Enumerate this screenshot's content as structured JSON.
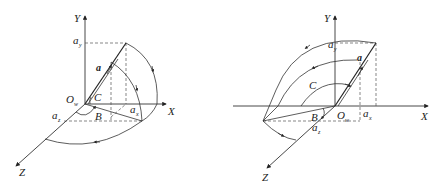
{
  "diagrams": [
    {
      "name": "left-diagram",
      "axes": {
        "x": "X",
        "y": "Y",
        "z": "Z"
      },
      "origin": {
        "main": "O",
        "sub": "w"
      },
      "vector": "a",
      "angles": {
        "b": "B",
        "c": "C"
      },
      "components": {
        "ay": {
          "main": "a",
          "sub": "y"
        },
        "az": {
          "main": "a",
          "sub": "z"
        },
        "ax": {
          "main": "a",
          "sub": "x"
        }
      }
    },
    {
      "name": "right-diagram",
      "axes": {
        "x": "X",
        "y": "Y",
        "z": "Z"
      },
      "origin": {
        "main": "O",
        "sub": "w"
      },
      "vector": "a",
      "angles": {
        "b": "B",
        "c": "C"
      },
      "components": {
        "ay": {
          "main": "a",
          "sub": "y"
        },
        "az": {
          "main": "a",
          "sub": "z"
        },
        "ax": {
          "main": "a",
          "sub": "x"
        }
      }
    }
  ]
}
